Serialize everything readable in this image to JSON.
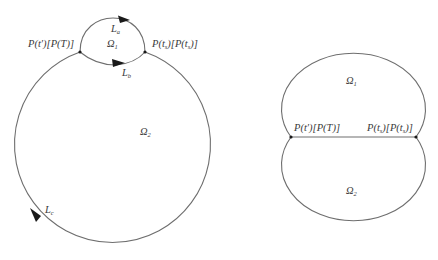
{
  "left_diagram": {
    "labels": {
      "left_point": "P(t′)[P(T)]",
      "right_point": "P(ts)[P(ts)]",
      "omega1": {
        "base": "Ω",
        "sub": "1"
      },
      "omega2": {
        "base": "Ω",
        "sub": "2"
      },
      "La": {
        "base": "L",
        "sub": "a"
      },
      "Lb": {
        "base": "L",
        "sub": "b"
      },
      "Lc": {
        "base": "L",
        "sub": "c"
      }
    },
    "left_point_parts": {
      "p1": "P(t′)[P(T)]"
    },
    "right_point_parts": {
      "a": "P(t",
      "a_sub": "s",
      "b": ")[P(t",
      "b_sub": "s",
      "c": ")]"
    }
  },
  "right_diagram": {
    "labels": {
      "left_point": "P(t′)[P(T)]",
      "omega1": {
        "base": "Ω",
        "sub": "1"
      },
      "omega2": {
        "base": "Ω",
        "sub": "2"
      }
    },
    "right_point_parts": {
      "a": "P(t",
      "a_sub": "s",
      "b": ")[P(t",
      "b_sub": "s",
      "c": ")]"
    }
  },
  "colors": {
    "stroke": "#6e6e6e",
    "arrow": "#1a1a1a",
    "text": "#3a3a3a"
  }
}
